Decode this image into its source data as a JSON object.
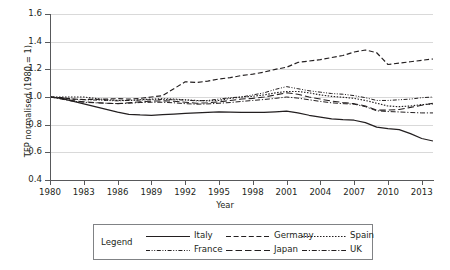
{
  "chart_data": {
    "type": "line",
    "title": "",
    "xlabel": "Year",
    "ylabel": "TFP normalised (1980 = 1)",
    "xlim": [
      1980,
      2014
    ],
    "ylim": [
      0.4,
      1.6
    ],
    "yticks": [
      "1.6",
      "1.4",
      "1.2",
      "1.0",
      "0.8",
      "0.6",
      "0.4"
    ],
    "xticks": [
      "1980",
      "1983",
      "1986",
      "1989",
      "1992",
      "1995",
      "1998",
      "2001",
      "2004",
      "2007",
      "2010",
      "2013"
    ],
    "grid": "horizontal",
    "legend_position": "below-plot",
    "legend_title": "Legend",
    "x": [
      1980,
      1981,
      1982,
      1983,
      1984,
      1985,
      1986,
      1987,
      1988,
      1989,
      1990,
      1991,
      1992,
      1993,
      1994,
      1995,
      1996,
      1997,
      1998,
      1999,
      2000,
      2001,
      2002,
      2003,
      2004,
      2005,
      2006,
      2007,
      2008,
      2009,
      2010,
      2011,
      2012,
      2013,
      2014
    ],
    "series": [
      {
        "name": "Italy",
        "style": "solid",
        "values": [
          1.0,
          0.99,
          0.97,
          0.95,
          0.93,
          0.91,
          0.89,
          0.875,
          0.87,
          0.868,
          0.872,
          0.877,
          0.881,
          0.885,
          0.889,
          0.893,
          0.891,
          0.889,
          0.888,
          0.889,
          0.893,
          0.898,
          0.885,
          0.868,
          0.855,
          0.842,
          0.836,
          0.832,
          0.815,
          0.782,
          0.772,
          0.764,
          0.735,
          0.7,
          0.682
        ]
      },
      {
        "name": "Germany",
        "style": "dashed",
        "values": [
          1.0,
          0.995,
          0.985,
          0.982,
          0.983,
          0.985,
          0.988,
          0.985,
          0.99,
          1.0,
          1.01,
          1.06,
          1.11,
          1.105,
          1.115,
          1.13,
          1.14,
          1.155,
          1.165,
          1.18,
          1.2,
          1.215,
          1.25,
          1.26,
          1.27,
          1.285,
          1.3,
          1.325,
          1.34,
          1.32,
          1.235,
          1.245,
          1.255,
          1.265,
          1.275
        ]
      },
      {
        "name": "Spain",
        "style": "dotted",
        "values": [
          1.0,
          1.0,
          1.0,
          1.0,
          0.99,
          0.98,
          0.975,
          0.975,
          0.98,
          0.985,
          0.988,
          0.985,
          0.98,
          0.975,
          0.972,
          0.975,
          0.99,
          1.0,
          1.005,
          1.015,
          1.03,
          1.04,
          1.04,
          1.03,
          1.015,
          1.005,
          0.998,
          0.99,
          0.975,
          0.955,
          0.935,
          0.93,
          0.935,
          0.945,
          0.95
        ]
      },
      {
        "name": "France",
        "style": "dashdotdot",
        "values": [
          1.0,
          0.995,
          0.985,
          0.98,
          0.978,
          0.975,
          0.972,
          0.975,
          0.978,
          0.98,
          0.982,
          0.98,
          0.978,
          0.972,
          0.975,
          0.985,
          0.995,
          1.0,
          1.015,
          1.03,
          1.055,
          1.075,
          1.06,
          1.045,
          1.035,
          1.025,
          1.02,
          1.01,
          0.995,
          0.975,
          0.975,
          0.98,
          0.985,
          0.995,
          1.0
        ]
      },
      {
        "name": "Japan",
        "style": "longdash",
        "values": [
          1.0,
          0.99,
          0.975,
          0.965,
          0.96,
          0.955,
          0.952,
          0.958,
          0.965,
          0.97,
          0.972,
          0.97,
          0.962,
          0.955,
          0.958,
          0.965,
          0.975,
          0.985,
          0.99,
          1.0,
          1.015,
          1.03,
          1.02,
          1.0,
          0.985,
          0.97,
          0.96,
          0.952,
          0.935,
          0.905,
          0.905,
          0.91,
          0.925,
          0.94,
          0.955
        ]
      },
      {
        "name": "UK",
        "style": "dashdot",
        "values": [
          1.0,
          0.985,
          0.97,
          0.962,
          0.958,
          0.955,
          0.952,
          0.955,
          0.96,
          0.962,
          0.962,
          0.958,
          0.952,
          0.948,
          0.95,
          0.955,
          0.96,
          0.968,
          0.975,
          0.982,
          0.99,
          1.0,
          0.992,
          0.98,
          0.968,
          0.958,
          0.952,
          0.948,
          0.93,
          0.9,
          0.895,
          0.892,
          0.888,
          0.885,
          0.885
        ]
      }
    ]
  },
  "legend": {
    "title": "Legend",
    "entries": [
      {
        "label": "Italy"
      },
      {
        "label": "Germany"
      },
      {
        "label": "Spain"
      },
      {
        "label": "France"
      },
      {
        "label": "Japan"
      },
      {
        "label": "UK"
      }
    ]
  }
}
